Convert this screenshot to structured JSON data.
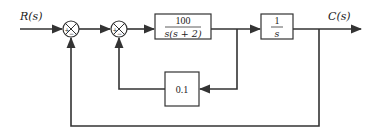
{
  "diagram": {
    "type": "block-diagram",
    "input_label": "R(s)",
    "output_label": "C(s)",
    "summing_junctions": [
      {
        "id": "sum1",
        "signs": {
          "left": "+",
          "bottom": "−"
        }
      },
      {
        "id": "sum2",
        "signs": {
          "left": "+",
          "bottom": "−"
        }
      }
    ],
    "blocks": {
      "plant": {
        "numerator": "100",
        "denominator": "s(s + 2)"
      },
      "integrator": {
        "numerator": "1",
        "denominator": "s"
      },
      "feedback_gain": {
        "value": "0.1"
      }
    },
    "colors": {
      "line": "#333333",
      "background": "#ffffff"
    }
  }
}
